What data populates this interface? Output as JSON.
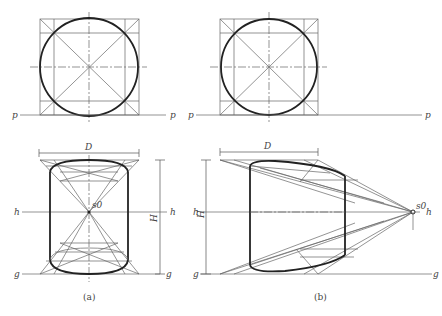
{
  "figure": {
    "panels": [
      {
        "caption": "(a)",
        "top_view": {
          "line_label_left": "p",
          "line_label_right": "p"
        },
        "front_view": {
          "width_label": "D",
          "height_label": "H",
          "horizon_label_left": "h",
          "horizon_label_right": "h",
          "ground_label_left": "g",
          "ground_label_right": "g",
          "vanishing_point_label": "s0"
        }
      },
      {
        "caption": "(b)",
        "top_view": {
          "line_label_left": "p",
          "line_label_right": "p"
        },
        "front_view": {
          "width_label": "D",
          "height_label": "H",
          "horizon_label_left": "h",
          "horizon_label_right": "h",
          "ground_label_left": "g",
          "ground_label_right": "g",
          "vanishing_point_label": "s0"
        }
      }
    ]
  }
}
